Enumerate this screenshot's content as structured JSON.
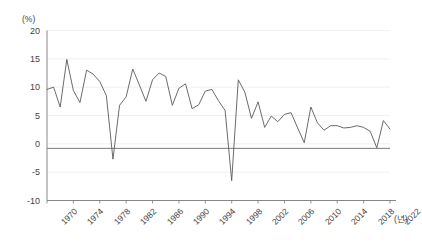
{
  "chart_data": {
    "type": "line",
    "title": "",
    "subtitle": "",
    "xlabel": "(년)",
    "ylabel": "(%)",
    "ylim": [
      -10,
      20
    ],
    "xlim": [
      1970,
      2022
    ],
    "grid": true,
    "legend": false,
    "legend_position": "none",
    "line_color": "#5a5a5a",
    "grid_color": "#ededed",
    "axis_color": "#7a7a7a",
    "zero_line_color": "#6b6b6b",
    "y_ticks": [
      20,
      15,
      10,
      5,
      0,
      -5,
      -10
    ],
    "y_tick_labels": [
      "20",
      "15",
      "10",
      "5",
      "0",
      "-5",
      "-10"
    ],
    "x_ticks": [
      1970,
      1974,
      1978,
      1982,
      1986,
      1990,
      1994,
      1998,
      2002,
      2006,
      2010,
      2014,
      2018,
      2022
    ],
    "x_tick_labels": [
      "1970",
      "1974",
      "1978",
      "1982",
      "1986",
      "1990",
      "1994",
      "1998",
      "2002",
      "2006",
      "2010",
      "2014",
      "2018",
      "2022"
    ],
    "series": [
      {
        "name": "growth-rate",
        "x": [
          1970,
          1971,
          1972,
          1973,
          1974,
          1975,
          1976,
          1977,
          1978,
          1979,
          1980,
          1981,
          1982,
          1983,
          1984,
          1985,
          1986,
          1987,
          1988,
          1989,
          1990,
          1991,
          1992,
          1993,
          1994,
          1995,
          1996,
          1997,
          1998,
          1999,
          2000,
          2001,
          2002,
          2003,
          2004,
          2005,
          2006,
          2007,
          2008,
          2009,
          2010,
          2011,
          2012,
          2013,
          2014,
          2015,
          2016,
          2017,
          2018,
          2019,
          2020,
          2021,
          2022
        ],
        "values": [
          9.6,
          10.0,
          6.5,
          14.9,
          9.4,
          7.3,
          13.0,
          12.3,
          11.0,
          8.5,
          -2.7,
          6.8,
          8.3,
          13.2,
          10.4,
          7.5,
          11.3,
          12.5,
          11.9,
          6.8,
          9.8,
          10.6,
          6.2,
          6.9,
          9.3,
          9.6,
          7.6,
          5.9,
          -6.5,
          11.3,
          9.1,
          4.5,
          7.4,
          2.9,
          4.9,
          3.9,
          5.2,
          5.5,
          2.8,
          0.2,
          6.5,
          3.7,
          2.4,
          3.2,
          3.2,
          2.8,
          2.9,
          3.2,
          2.9,
          2.2,
          -0.7,
          4.1,
          2.6
        ]
      }
    ]
  },
  "axis_unit_labels": {
    "y_unit": "(%)",
    "x_unit": "(년)"
  }
}
